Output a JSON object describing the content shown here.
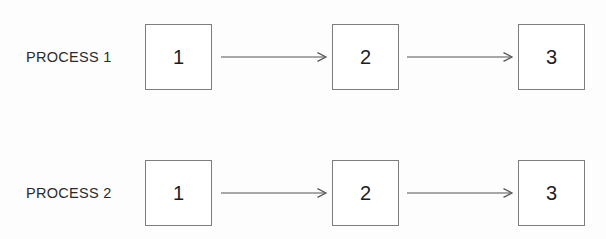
{
  "diagram": {
    "type": "flow-diagram",
    "background_color": "#fdfdfd",
    "box_border_color": "#7d7d7d",
    "line_color": "#555555",
    "text_color": "#2b2b2b",
    "rows": [
      {
        "label": "PROCESS 1",
        "nodes": [
          {
            "label": "1"
          },
          {
            "label": "2"
          },
          {
            "label": "3"
          }
        ],
        "connectors": [
          {
            "name": "arrow-1-to-2",
            "style": "open-arrowhead"
          },
          {
            "name": "arrow-2-to-3",
            "style": "open-arrowhead"
          }
        ]
      },
      {
        "label": "PROCESS 2",
        "nodes": [
          {
            "label": "1"
          },
          {
            "label": "2"
          },
          {
            "label": "3"
          }
        ],
        "connectors": [
          {
            "name": "arrow-1-to-2",
            "style": "open-arrowhead"
          },
          {
            "name": "arrow-2-to-3",
            "style": "open-arrowhead"
          }
        ]
      }
    ]
  }
}
